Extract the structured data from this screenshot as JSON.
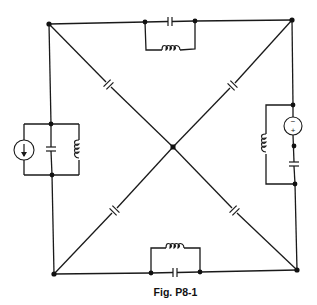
{
  "figure": {
    "caption": "Fig. P8-1",
    "type": "circuit-schematic",
    "colors": {
      "line": "#1a1a1a",
      "background": "#ffffff"
    }
  },
  "nodes": [
    {
      "id": "top-left",
      "x": 49,
      "y": 24
    },
    {
      "id": "top-right",
      "x": 292,
      "y": 20
    },
    {
      "id": "bottom-right",
      "x": 297,
      "y": 270
    },
    {
      "id": "bottom-left",
      "x": 54,
      "y": 274
    },
    {
      "id": "center",
      "x": 173,
      "y": 147
    },
    {
      "id": "left-branch-top",
      "x": 51,
      "y": 124
    },
    {
      "id": "left-branch-bottom",
      "x": 52,
      "y": 175
    },
    {
      "id": "top-branch-left",
      "x": 145,
      "y": 22
    },
    {
      "id": "top-branch-right",
      "x": 195,
      "y": 21
    },
    {
      "id": "right-branch-top",
      "x": 293,
      "y": 105
    },
    {
      "id": "right-branch-mid",
      "x": 294,
      "y": 146
    },
    {
      "id": "right-branch-bottom",
      "x": 295,
      "y": 184
    },
    {
      "id": "bottom-branch-left",
      "x": 151,
      "y": 273
    },
    {
      "id": "bottom-branch-right",
      "x": 200,
      "y": 272
    }
  ],
  "components": {
    "top_branch": [
      "capacitor (series)",
      "inductor (parallel)"
    ],
    "left_branch": [
      "current source (arrow down)",
      "capacitor",
      "inductor"
    ],
    "right_branch": [
      "voltage source (- top, + bottom)",
      "capacitor (series)",
      "inductor (parallel)"
    ],
    "bottom_branch": [
      "inductor (parallel)",
      "capacitor (series)"
    ],
    "diagonals": [
      "capacitor top-left to center",
      "capacitor top-right to center",
      "capacitor bottom-left to center",
      "capacitor bottom-right to center"
    ]
  },
  "labels": {
    "voltage_source_minus": "−",
    "voltage_source_plus": "+"
  }
}
